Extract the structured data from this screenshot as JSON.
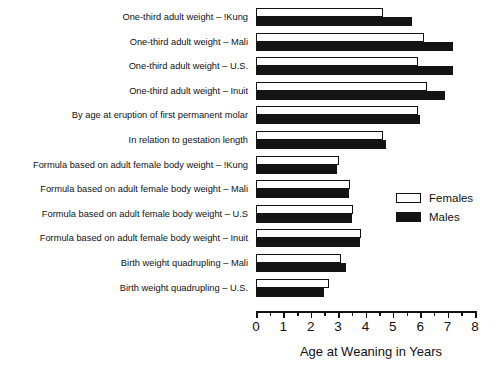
{
  "chart_data": {
    "type": "bar",
    "orientation": "horizontal",
    "title": "",
    "xlabel": "Age at Weaning in Years",
    "ylabel": "",
    "xlim": [
      0,
      8
    ],
    "xticks": [
      0,
      1,
      2,
      3,
      4,
      5,
      6,
      7,
      8
    ],
    "xtick_labels": [
      "0",
      "1",
      "2",
      "3",
      "4",
      "5",
      "6",
      "7",
      "8"
    ],
    "minor_ticks": [
      0.5,
      1.5,
      2.5,
      3.5,
      4.5,
      5.5,
      6.5,
      7.5
    ],
    "grid": false,
    "legend_position": "center-right",
    "categories": [
      "One-third adult weight – !Kung",
      "One-third adult weight – Mali",
      "One-third adult weight – U.S.",
      "One-third adult weight – Inuit",
      "By age at eruption of first permanent molar",
      "In relation to gestation length",
      "Formula based on adult female body weight – !Kung",
      "Formula based on adult female body weight – Mali",
      "Formula based on adult female body weight – U.S",
      "Formula based on adult female body weight – Inuit",
      "Birth weight quadrupling – Mali",
      "Birth weight quadrupling – U.S."
    ],
    "series": [
      {
        "name": "Females",
        "color": "#ffffff",
        "edge_color": "#111111",
        "values": [
          4.65,
          6.15,
          5.9,
          6.25,
          5.9,
          4.65,
          3.05,
          3.45,
          3.55,
          3.85,
          3.1,
          2.65
        ]
      },
      {
        "name": "Males",
        "color": "#141414",
        "edge_color": "#141414",
        "values": [
          5.7,
          7.2,
          7.2,
          6.9,
          6.0,
          4.75,
          2.95,
          3.4,
          3.5,
          3.8,
          3.3,
          2.5
        ]
      }
    ]
  },
  "legend": {
    "entries": [
      {
        "label": "Females",
        "swatch": "open-rectangle"
      },
      {
        "label": "Males",
        "swatch": "filled-rectangle"
      }
    ]
  },
  "axis": {
    "x_title": "Age at Weaning in Years"
  }
}
